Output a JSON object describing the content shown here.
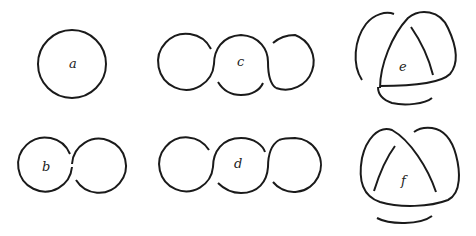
{
  "figure": {
    "stroke_color": "#1a1a1a",
    "background": "#ffffff",
    "panels": [
      {
        "id": "a",
        "label": "a",
        "kind": "single circle (unknot)"
      },
      {
        "id": "b",
        "label": "b",
        "kind": "two circles with one crossing"
      },
      {
        "id": "c",
        "label": "c",
        "kind": "three circles chain with crossings"
      },
      {
        "id": "d",
        "label": "d",
        "kind": "three circles chain with crossings"
      },
      {
        "id": "e",
        "label": "e",
        "kind": "trefoil-like triangular knot"
      },
      {
        "id": "f",
        "label": "f",
        "kind": "trefoil-like triangular knot"
      }
    ]
  }
}
